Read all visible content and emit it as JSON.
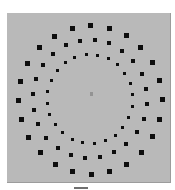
{
  "figure": {
    "background_color": "#b9b9b9",
    "dot_color": "#0d0d0d",
    "center": [
      91,
      94
    ],
    "rings": [
      {
        "name": "outer",
        "size": 5,
        "points": [
          [
            90,
            25
          ],
          [
            109,
            28
          ],
          [
            126,
            35
          ],
          [
            140,
            47
          ],
          [
            152,
            62
          ],
          [
            159,
            80
          ],
          [
            162,
            99
          ],
          [
            159,
            119
          ],
          [
            152,
            136
          ],
          [
            141,
            152
          ],
          [
            126,
            164
          ],
          [
            109,
            171
          ],
          [
            91,
            174
          ],
          [
            72,
            171
          ],
          [
            55,
            164
          ],
          [
            40,
            152
          ],
          [
            28,
            137
          ],
          [
            21,
            119
          ],
          [
            18,
            100
          ],
          [
            20,
            81
          ],
          [
            27,
            63
          ],
          [
            39,
            47
          ],
          [
            54,
            36
          ],
          [
            72,
            28
          ]
        ]
      },
      {
        "name": "middle",
        "size": 4,
        "points": [
          [
            80,
            41
          ],
          [
            95,
            40
          ],
          [
            109,
            43
          ],
          [
            122,
            51
          ],
          [
            133,
            61
          ],
          [
            142,
            74
          ],
          [
            146,
            89
          ],
          [
            147,
            104
          ],
          [
            144,
            119
          ],
          [
            137,
            132
          ],
          [
            126,
            144
          ],
          [
            114,
            152
          ],
          [
            100,
            157
          ],
          [
            85,
            158
          ],
          [
            71,
            155
          ],
          [
            58,
            148
          ],
          [
            46,
            138
          ],
          [
            38,
            124
          ],
          [
            34,
            110
          ],
          [
            33,
            94
          ],
          [
            36,
            79
          ],
          [
            43,
            65
          ],
          [
            53,
            54
          ],
          [
            66,
            45
          ]
        ]
      },
      {
        "name": "inner",
        "size": 3,
        "points": [
          [
            86,
            54
          ],
          [
            97,
            55
          ],
          [
            108,
            58
          ],
          [
            117,
            64
          ],
          [
            124,
            73
          ],
          [
            130,
            83
          ],
          [
            132,
            94
          ],
          [
            132,
            106
          ],
          [
            128,
            117
          ],
          [
            122,
            127
          ],
          [
            115,
            135
          ],
          [
            105,
            140
          ],
          [
            94,
            143
          ],
          [
            82,
            142
          ],
          [
            72,
            139
          ],
          [
            62,
            132
          ],
          [
            55,
            124
          ],
          [
            49,
            114
          ],
          [
            47,
            103
          ],
          [
            47,
            91
          ],
          [
            51,
            80
          ],
          [
            57,
            70
          ],
          [
            65,
            62
          ],
          [
            74,
            57
          ]
        ]
      }
    ]
  }
}
